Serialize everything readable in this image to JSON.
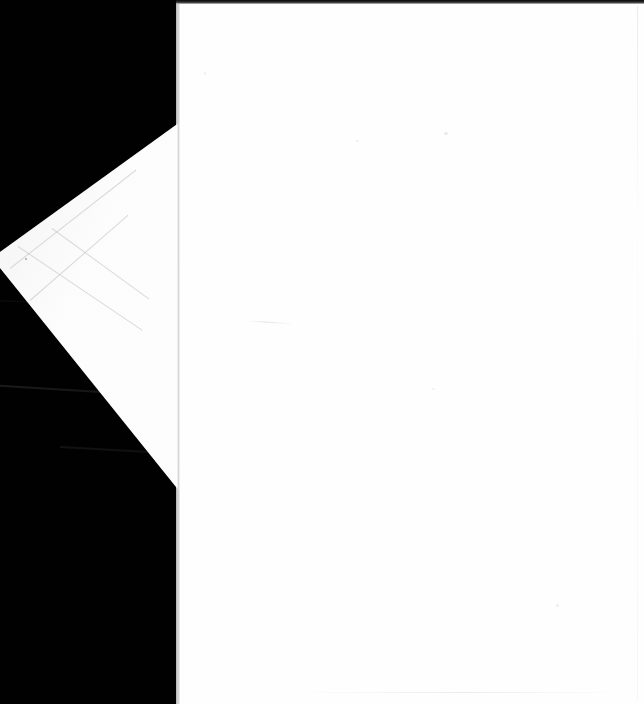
{
  "image": {
    "kind": "scanned-document-page",
    "width": 644,
    "height": 704,
    "caption": "",
    "visible_text": "",
    "description": "Blank white scanned sheet on a black scanner background with a folded-back triangular corner flap on the left side"
  },
  "colors": {
    "scanner_background": "#010101",
    "page_white": "#fefefe",
    "flap_white": "#fdfdfd",
    "fold_crease": "#cecdd4",
    "top_edge_bar": "#0a0a0a",
    "backdrop_streak": "#121212"
  },
  "regions": {
    "backdrop": {
      "name": "scanner-backdrop",
      "x": 0,
      "y": 0,
      "width": 644,
      "height": 704
    },
    "sheet": {
      "name": "scanned-page",
      "x": 176,
      "y": 4,
      "width": 468,
      "height": 700
    },
    "top_bar": {
      "name": "scanner-top-edge",
      "x": 176,
      "y": 0,
      "width": 468,
      "height": 4
    },
    "corner_flap": {
      "name": "folded-corner-flap",
      "apex_x": 0,
      "apex_y": 260,
      "top_vertex_x": 176,
      "top_vertex_y": 122,
      "bottom_vertex_x": 176,
      "bottom_vertex_y": 490
    },
    "fold_crease": {
      "name": "vertical-fold-crease",
      "x": 178,
      "y": 4,
      "width": 3,
      "height": 700
    }
  },
  "artifacts": {
    "backdrop_streaks": 3,
    "flap_creases": 4,
    "page_specks": 5,
    "page_creases": 2
  }
}
